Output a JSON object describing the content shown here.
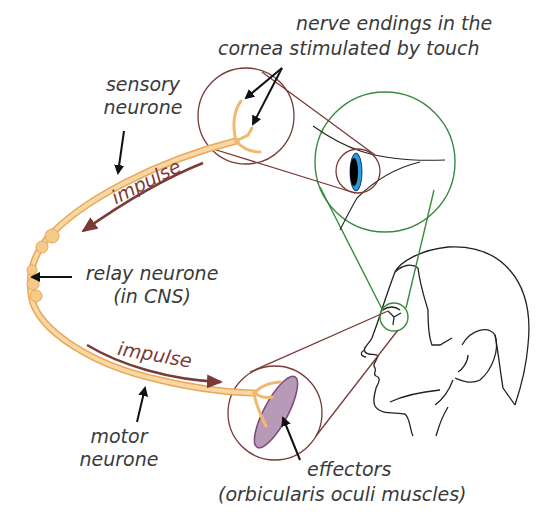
{
  "diagram": {
    "colors": {
      "neurone_fill": "#f5c98a",
      "neurone_stroke": "#e8a85a",
      "impulse_arrow": "#7a3a36",
      "magnifier_red": "#7a3a36",
      "magnifier_green": "#3a8a40",
      "effector_muscle": "#a88aa8",
      "iris": "#2a9ad8",
      "label_text": "#3a3a3a",
      "pointer_arrow": "#111111"
    },
    "labels": {
      "nerve_endings_line1": "nerve endings in the",
      "nerve_endings_line2": "cornea stimulated by touch",
      "sensory_line1": "sensory",
      "sensory_line2": "neurone",
      "impulse_top": "impulse",
      "relay_line1": "relay neurone",
      "relay_line2": "(in CNS)",
      "impulse_bottom": "impulse",
      "motor_line1": "motor",
      "motor_line2": "neurone",
      "effectors_line1": "effectors",
      "effectors_line2": "(orbicularis oculi muscles)"
    },
    "nodes": [
      {
        "id": "receptor",
        "label": "nerve endings in the cornea"
      },
      {
        "id": "sensory-neurone",
        "label": "sensory neurone"
      },
      {
        "id": "relay-neurone",
        "label": "relay neurone (in CNS)"
      },
      {
        "id": "motor-neurone",
        "label": "motor neurone"
      },
      {
        "id": "effector",
        "label": "effectors (orbicularis oculi muscles)"
      }
    ],
    "edges": [
      {
        "from": "receptor",
        "to": "sensory-neurone",
        "label": "impulse"
      },
      {
        "from": "sensory-neurone",
        "to": "relay-neurone"
      },
      {
        "from": "relay-neurone",
        "to": "motor-neurone"
      },
      {
        "from": "motor-neurone",
        "to": "effector",
        "label": "impulse"
      }
    ]
  }
}
